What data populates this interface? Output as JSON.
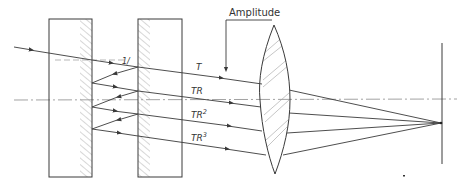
{
  "diagram": {
    "labels": {
      "amplitude": "Amplitude",
      "incident": "1/",
      "beam_t": "T",
      "beam_tr": "TR",
      "beam_tr2_base": "TR",
      "beam_tr2_exp": "2",
      "beam_tr3_base": "TR",
      "beam_tr3_exp": "3"
    },
    "components": [
      {
        "name": "plate-1",
        "x": [
          49,
          92
        ],
        "y": [
          19,
          177
        ],
        "coated_surface": "right"
      },
      {
        "name": "plate-2",
        "x": [
          138,
          182
        ],
        "y": [
          19,
          177
        ],
        "coated_surface": "left"
      },
      {
        "name": "lens",
        "center_x": 275,
        "top_y": 25,
        "bottom_y": 174
      },
      {
        "name": "screen",
        "x": 442,
        "y": [
          43,
          164
        ]
      }
    ],
    "optical_axis_y": 100,
    "focus_point": [
      441,
      123
    ],
    "colors": {
      "line": "#3a3a3a",
      "hatch": "#9a9a9a",
      "axis": "#8a8a8a"
    }
  }
}
